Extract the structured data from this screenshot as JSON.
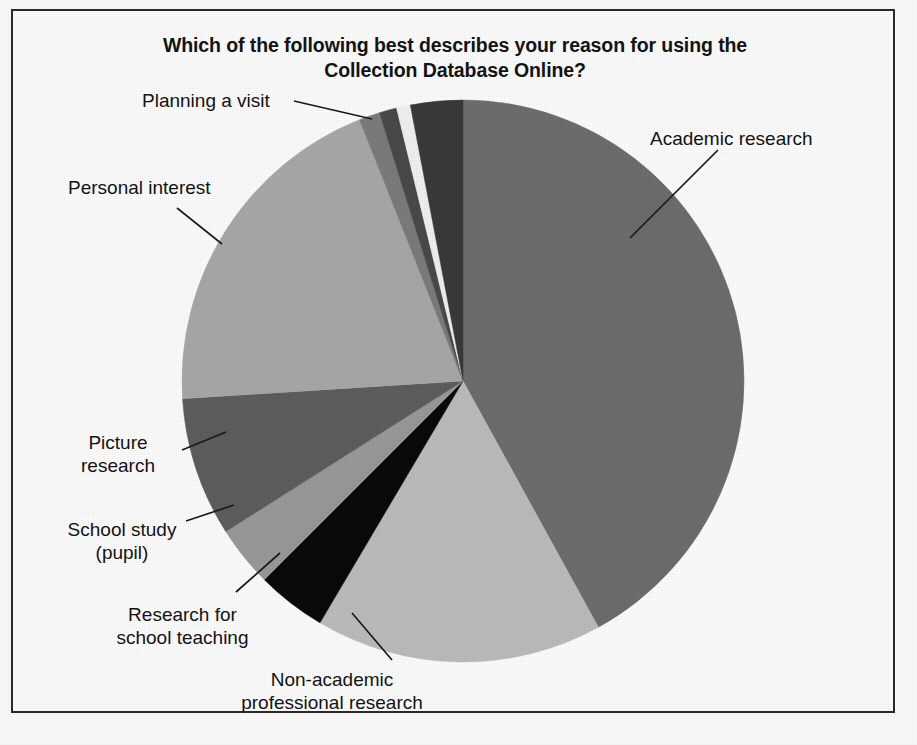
{
  "chart_data": {
    "type": "pie",
    "title": "Which of the following best describes your reason for using the\nCollection Database Online?",
    "title_line1": "Which of the following best describes your reason for using the",
    "title_line2": "Collection Database Online?",
    "legend_position": "callout-labels",
    "grid": false,
    "start_angle_deg": 0,
    "direction": "clockwise",
    "labels": [
      "Academic research",
      "Non-academic professional research",
      "Research for school teaching",
      "School study (pupil)",
      "Picture research",
      "Personal interest",
      "Planning a visit"
    ],
    "categories": [
      "Academic research",
      "Non-academic professional research",
      "Research for school teaching",
      "School study (pupil)",
      "Picture research",
      "Personal interest",
      "Other (unlabelled sliver A)",
      "Other (unlabelled sliver B)",
      "Other (unlabelled sliver C)",
      "Planning a visit"
    ],
    "values": [
      42.0,
      16.5,
      4.0,
      3.5,
      8.0,
      20.0,
      1.2,
      1.0,
      0.8,
      3.0
    ],
    "colors": [
      "#6e6e6e",
      "#bdbdbd",
      "#0a0a0a",
      "#9a9a9a",
      "#5e5e5e",
      "#a9a9a9",
      "#7c7c7c",
      "#4a4a4a",
      "#f2f2f2",
      "#3a3a3a"
    ],
    "xlabel": "",
    "ylabel": ""
  },
  "labels": {
    "academic": "Academic research",
    "nonacademic": "Non-academic\nprofessional research",
    "teaching": "Research for\nschool teaching",
    "pupil": "School study\n(pupil)",
    "picture": "Picture\nresearch",
    "personal": "Personal interest",
    "planning": "Planning a visit"
  },
  "style": {
    "frame_color": "#2c2c2c",
    "background": "#fefefe",
    "text_color": "#141414"
  }
}
